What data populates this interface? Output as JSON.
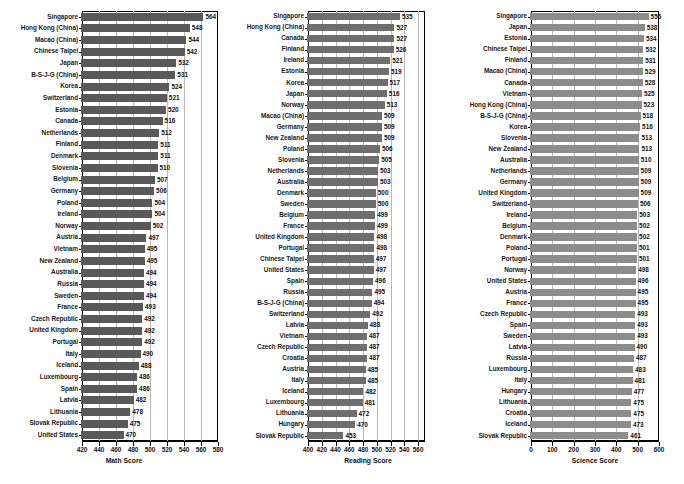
{
  "figure": {
    "caption": "",
    "panel_count": 3
  },
  "chart_data": [
    {
      "type": "bar",
      "orientation": "horizontal",
      "title": "",
      "xlabel": "Math Score",
      "ylabel": "",
      "xlim": [
        420,
        580
      ],
      "xticks": [
        420,
        440,
        460,
        480,
        500,
        520,
        540,
        560,
        580
      ],
      "grid": "vertical",
      "legend": "none",
      "bar_color": "#595959",
      "sorted": "descending",
      "categories": [
        "Singapore",
        "Hong Kong (China)",
        "Macao (China)",
        "Chinese Taipei",
        "Japan",
        "B-S-J-G (China)",
        "Korea",
        "Switzerland",
        "Estonia",
        "Canada",
        "Netherlands",
        "Finland",
        "Denmark",
        "Slovenia",
        "Belgium",
        "Germany",
        "Poland",
        "Ireland",
        "Norway",
        "Austria",
        "Vietnam",
        "New Zealand",
        "Australia",
        "Russia",
        "Sweden",
        "France",
        "Czech Republic",
        "United Kingdom",
        "Portugal",
        "Italy",
        "Iceland",
        "Luxembourg",
        "Spain",
        "Latvia",
        "Lithuania",
        "Slovak Republic",
        "United States"
      ],
      "values": [
        564,
        548,
        544,
        542,
        532,
        531,
        524,
        521,
        520,
        516,
        512,
        511,
        511,
        510,
        507,
        506,
        504,
        504,
        502,
        497,
        495,
        495,
        494,
        494,
        494,
        493,
        492,
        492,
        492,
        490,
        488,
        486,
        486,
        482,
        478,
        475,
        470
      ]
    },
    {
      "type": "bar",
      "orientation": "horizontal",
      "title": "",
      "xlabel": "Reading Score",
      "ylabel": "",
      "xlim": [
        400,
        570
      ],
      "xticks": [
        400,
        420,
        440,
        460,
        480,
        500,
        520,
        540,
        560
      ],
      "grid": "vertical",
      "legend": "none",
      "bar_color": "#6e6e6e",
      "sorted": "descending",
      "categories": [
        "Singapore",
        "Hong Kong (China)",
        "Canada",
        "Finland",
        "Ireland",
        "Estonia",
        "Korea",
        "Japan",
        "Norway",
        "Macao (China)",
        "Germany",
        "New Zealand",
        "Poland",
        "Slovenia",
        "Netherlands",
        "Australia",
        "Denmark",
        "Sweden",
        "Belgium",
        "France",
        "United Kingdom",
        "Portugal",
        "Chinese Taipei",
        "United States",
        "Spain",
        "Russia",
        "B-S-J-G (China)",
        "Switzerland",
        "Latvia",
        "Vietnam",
        "Czech Republic",
        "Croatia",
        "Austria",
        "Italy",
        "Iceland",
        "Luxembourg",
        "Lithuania",
        "Hungary",
        "Slovak Republic"
      ],
      "values": [
        535,
        527,
        527,
        526,
        521,
        519,
        517,
        516,
        513,
        509,
        509,
        509,
        506,
        505,
        503,
        503,
        500,
        500,
        499,
        499,
        498,
        498,
        497,
        497,
        496,
        495,
        494,
        492,
        488,
        487,
        487,
        487,
        485,
        485,
        482,
        481,
        472,
        470,
        453
      ]
    },
    {
      "type": "bar",
      "orientation": "horizontal",
      "title": "",
      "xlabel": "Science Score",
      "ylabel": "",
      "xlim": [
        0,
        600
      ],
      "xticks": [
        0,
        100,
        200,
        300,
        400,
        500,
        600
      ],
      "grid": "vertical",
      "legend": "none",
      "bar_color": "#8c8c8c",
      "sorted": "descending",
      "categories": [
        "Singapore",
        "Japan",
        "Estonia",
        "Chinese Taipei",
        "Finland",
        "Macao (China)",
        "Canada",
        "Vietnam",
        "Hong Kong (China)",
        "B-S-J-G (China)",
        "Korea",
        "Slovenia",
        "New Zealand",
        "Australia",
        "Netherlands",
        "Germany",
        "United Kingdom",
        "Switzerland",
        "Ireland",
        "Belgium",
        "Denmark",
        "Poland",
        "Portugal",
        "Norway",
        "United States",
        "Austria",
        "France",
        "Czech Republic",
        "Spain",
        "Sweden",
        "Latvia",
        "Russia",
        "Luxembourg",
        "Italy",
        "Hungary",
        "Lithuania",
        "Croatia",
        "Iceland",
        "Slovak Republic"
      ],
      "values": [
        556,
        538,
        534,
        532,
        531,
        529,
        528,
        525,
        523,
        518,
        516,
        513,
        513,
        510,
        509,
        509,
        509,
        506,
        503,
        502,
        502,
        501,
        501,
        498,
        496,
        495,
        495,
        493,
        493,
        493,
        490,
        487,
        483,
        481,
        477,
        475,
        475,
        473,
        461
      ]
    }
  ]
}
